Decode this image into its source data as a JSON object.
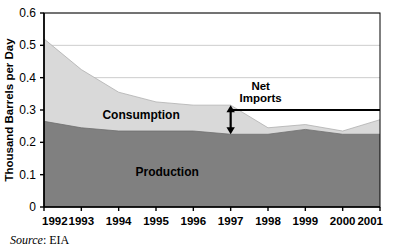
{
  "figure": {
    "source_prefix": "Source",
    "source_separator": ": ",
    "source_value": "EIA",
    "background_color": "#ffffff"
  },
  "colors": {
    "production_fill": "#808080",
    "consumption_fill": "#d9d9d9",
    "gridline": "#bfbfbf",
    "axis": "#000000",
    "net_imports_line": "#000000",
    "text": "#000000"
  },
  "chart_data": {
    "type": "area",
    "title": "",
    "xlabel": "",
    "ylabel": "Thousand Barrels per Day",
    "categories": [
      "1992",
      "1993",
      "1994",
      "1995",
      "1996",
      "1997",
      "1998",
      "1999",
      "2000",
      "2001"
    ],
    "x": [
      1992,
      1993,
      1994,
      1995,
      1996,
      1997,
      1998,
      1999,
      2000,
      2001
    ],
    "xlim": [
      1992,
      2001
    ],
    "ylim": [
      0,
      0.6
    ],
    "ytick_values": [
      0,
      0.1,
      0.2,
      0.3,
      0.4,
      0.5,
      0.6
    ],
    "ytick_labels": [
      "0",
      "0.1",
      "0.2",
      "0.3",
      "0.4",
      "0.5",
      "0.6"
    ],
    "grid": true,
    "legend": "inline-labels",
    "series": [
      {
        "name": "Consumption",
        "stacking": "total-upper-boundary",
        "fill": "#d9d9d9",
        "values": [
          0.52,
          0.425,
          0.355,
          0.325,
          0.315,
          0.315,
          0.245,
          0.255,
          0.235,
          0.27
        ]
      },
      {
        "name": "Production",
        "stacking": "lower-band",
        "fill": "#808080",
        "values": [
          0.265,
          0.245,
          0.235,
          0.235,
          0.235,
          0.225,
          0.225,
          0.24,
          0.225,
          0.225
        ]
      }
    ],
    "annotations": [
      {
        "name": "net-imports",
        "label_line1": "Net",
        "label_line2": "Imports",
        "arrow_year": 1997,
        "arrow_top_value": 0.315,
        "arrow_bottom_value": 0.225,
        "reference_line_value": 0.3,
        "reference_line_from_year": 1997,
        "reference_line_to_year": 2001
      },
      {
        "name": "consumption-inline-label",
        "label": "Consumption",
        "year": 1994.6,
        "value": 0.272
      },
      {
        "name": "production-inline-label",
        "label": "Production",
        "year": 1995.3,
        "value": 0.095
      }
    ]
  }
}
